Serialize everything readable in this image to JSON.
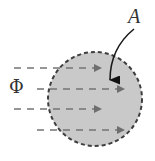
{
  "diagram": {
    "labels": {
      "flux": "Φ",
      "area": "A"
    },
    "colors": {
      "disk_fill": "#c8c8c8",
      "disk_border": "#444444",
      "field_lines": "#777777",
      "pointer": "#222222"
    },
    "field_lines_count": 4
  }
}
